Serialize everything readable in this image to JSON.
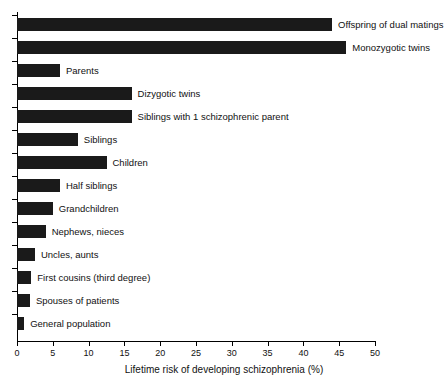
{
  "chart_data": {
    "type": "bar",
    "orientation": "horizontal",
    "title": "",
    "xlabel": "Lifetime risk of developing schizophrenia (%)",
    "ylabel": "",
    "xlim": [
      0,
      50
    ],
    "xticks": [
      0,
      5,
      10,
      15,
      20,
      25,
      30,
      35,
      40,
      45,
      50
    ],
    "grid": false,
    "legend": null,
    "bar_color": "#1a1a1a",
    "categories": [
      "Offspring of dual matings",
      "Monozygotic twins",
      "Parents",
      "Dizygotic twins",
      "Siblings with 1 schizophrenic parent",
      "Siblings",
      "Children",
      "Half siblings",
      "Grandchildren",
      "Nephews, nieces",
      "Uncles, aunts",
      "First cousins (third degree)",
      "Spouses of patients",
      "General population"
    ],
    "values": [
      44,
      46,
      6,
      16,
      16,
      8.5,
      12.5,
      6,
      5,
      4,
      2.5,
      2,
      1.8,
      1
    ]
  },
  "axis": {
    "title": "Lifetime risk of developing schizophrenia (%)"
  }
}
